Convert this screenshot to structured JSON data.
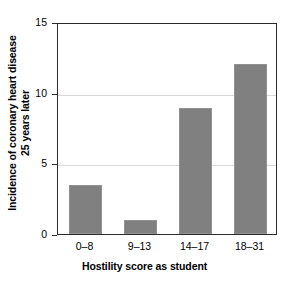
{
  "chart_data": {
    "type": "bar",
    "title": "",
    "subtitle": "",
    "xlabel": "Hostility score as student",
    "ylabel": "Incidence of coronary heart disease 25 years later",
    "ylabel_lines": [
      "Incidence of coronary heart disease",
      "25 years later"
    ],
    "categories": [
      "0–8",
      "9–13",
      "14–17",
      "18–31"
    ],
    "values": [
      3.5,
      1.0,
      8.9,
      12.0
    ],
    "ylim": [
      0,
      15
    ],
    "yticks": [
      0,
      5,
      10,
      15
    ],
    "ytick_labels": [
      "0",
      "5",
      "10",
      "15"
    ],
    "gridlines_at": [
      5,
      10
    ],
    "grid": true,
    "legend": "none",
    "bar_color": "#808080",
    "axis_color": "#2b2b2b",
    "grid_color": "#d8d8d8",
    "background": "#ffffff"
  }
}
